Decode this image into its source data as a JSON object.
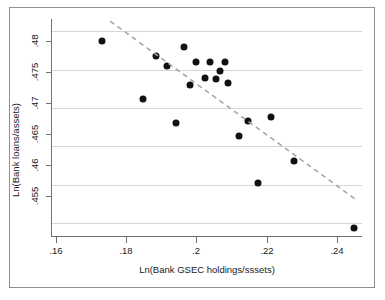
{
  "chart_data": {
    "type": "scatter",
    "title": "",
    "xlabel": "Ln(Bank GSEC holdings/sssets)",
    "ylabel": "Ln(Bank loans/assets)",
    "xlim": [
      0.1517,
      0.2503
    ],
    "ylim": [
      0.4533,
      0.4815
    ],
    "xticks": [
      0.16,
      0.18,
      0.2,
      0.22,
      0.24
    ],
    "xtick_labels": [
      ".16",
      ".18",
      ".2",
      ".22",
      ".24"
    ],
    "yticks": [
      0.455,
      0.46,
      0.465,
      0.47,
      0.475,
      0.48
    ],
    "ytick_labels": [
      ".455",
      ".46",
      ".465",
      ".47",
      ".475",
      ".48"
    ],
    "grid": "horizontal",
    "legend": "none",
    "marker": {
      "shape": "circle",
      "color": "#111111",
      "size": 7
    },
    "points": [
      {
        "x": 0.1675,
        "y": 0.47875
      },
      {
        "x": 0.1807,
        "y": 0.47125
      },
      {
        "x": 0.1849,
        "y": 0.47675
      },
      {
        "x": 0.1883,
        "y": 0.47545
      },
      {
        "x": 0.1912,
        "y": 0.46805
      },
      {
        "x": 0.1936,
        "y": 0.47795
      },
      {
        "x": 0.1957,
        "y": 0.47305
      },
      {
        "x": 0.1974,
        "y": 0.47605
      },
      {
        "x": 0.2004,
        "y": 0.47395
      },
      {
        "x": 0.2019,
        "y": 0.47605
      },
      {
        "x": 0.2038,
        "y": 0.47375
      },
      {
        "x": 0.205,
        "y": 0.47485
      },
      {
        "x": 0.2068,
        "y": 0.47605
      },
      {
        "x": 0.2077,
        "y": 0.47325
      },
      {
        "x": 0.2113,
        "y": 0.46635
      },
      {
        "x": 0.214,
        "y": 0.4683
      },
      {
        "x": 0.2172,
        "y": 0.4602
      },
      {
        "x": 0.2214,
        "y": 0.4688
      },
      {
        "x": 0.2288,
        "y": 0.46305
      },
      {
        "x": 0.2476,
        "y": 0.4543
      }
    ],
    "fit_line": {
      "style": "dashed",
      "color": "#a8a8a0",
      "x_start": 0.1702,
      "y_start": 0.48135,
      "x_end": 0.2489,
      "y_end": 0.4579
    }
  },
  "axes": {
    "y_title": "Ln(Bank loans/assets)",
    "x_title": "Ln(Bank GSEC holdings/sssets)"
  }
}
